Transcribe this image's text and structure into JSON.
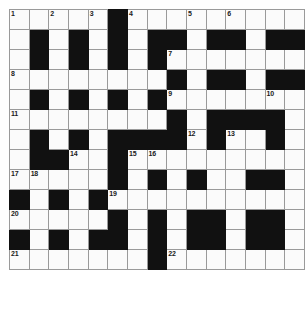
{
  "puzzle": {
    "title": "Crossword Grid",
    "type": "crossword",
    "columns": 15,
    "rows": 13,
    "colors": {
      "block": "#111111",
      "cell": "#fbfbfb",
      "grid_line": "#9a9a9a",
      "number_text": "#1a1a1a",
      "background": "#ffffff"
    },
    "clue_numbers_present": [
      1,
      2,
      3,
      4,
      5,
      6,
      7,
      8,
      9,
      10,
      11,
      12,
      13,
      14,
      15,
      16,
      17,
      18,
      19,
      20,
      21,
      22
    ],
    "grid": [
      [
        {
          "block": false,
          "num": "1"
        },
        {
          "block": false,
          "num": ""
        },
        {
          "block": false,
          "num": "2"
        },
        {
          "block": false,
          "num": ""
        },
        {
          "block": false,
          "num": "3"
        },
        {
          "block": true,
          "num": ""
        },
        {
          "block": false,
          "num": "4"
        },
        {
          "block": false,
          "num": ""
        },
        {
          "block": false,
          "num": ""
        },
        {
          "block": false,
          "num": "5"
        },
        {
          "block": false,
          "num": ""
        },
        {
          "block": false,
          "num": "6"
        },
        {
          "block": false,
          "num": ""
        },
        {
          "block": false,
          "num": ""
        },
        {
          "block": false,
          "num": ""
        }
      ],
      [
        {
          "block": false,
          "num": ""
        },
        {
          "block": true,
          "num": ""
        },
        {
          "block": false,
          "num": ""
        },
        {
          "block": true,
          "num": ""
        },
        {
          "block": false,
          "num": ""
        },
        {
          "block": true,
          "num": ""
        },
        {
          "block": false,
          "num": ""
        },
        {
          "block": true,
          "num": ""
        },
        {
          "block": true,
          "num": ""
        },
        {
          "block": false,
          "num": ""
        },
        {
          "block": true,
          "num": ""
        },
        {
          "block": true,
          "num": ""
        },
        {
          "block": false,
          "num": ""
        },
        {
          "block": true,
          "num": ""
        },
        {
          "block": true,
          "num": ""
        }
      ],
      [
        {
          "block": false,
          "num": ""
        },
        {
          "block": true,
          "num": ""
        },
        {
          "block": false,
          "num": ""
        },
        {
          "block": true,
          "num": ""
        },
        {
          "block": false,
          "num": ""
        },
        {
          "block": true,
          "num": ""
        },
        {
          "block": false,
          "num": ""
        },
        {
          "block": true,
          "num": ""
        },
        {
          "block": false,
          "num": "7"
        },
        {
          "block": false,
          "num": ""
        },
        {
          "block": false,
          "num": ""
        },
        {
          "block": false,
          "num": ""
        },
        {
          "block": false,
          "num": ""
        },
        {
          "block": false,
          "num": ""
        },
        {
          "block": false,
          "num": ""
        }
      ],
      [
        {
          "block": false,
          "num": "8"
        },
        {
          "block": false,
          "num": ""
        },
        {
          "block": false,
          "num": ""
        },
        {
          "block": false,
          "num": ""
        },
        {
          "block": false,
          "num": ""
        },
        {
          "block": false,
          "num": ""
        },
        {
          "block": false,
          "num": ""
        },
        {
          "block": false,
          "num": ""
        },
        {
          "block": true,
          "num": ""
        },
        {
          "block": false,
          "num": ""
        },
        {
          "block": true,
          "num": ""
        },
        {
          "block": true,
          "num": ""
        },
        {
          "block": false,
          "num": ""
        },
        {
          "block": true,
          "num": ""
        },
        {
          "block": true,
          "num": ""
        }
      ],
      [
        {
          "block": false,
          "num": ""
        },
        {
          "block": true,
          "num": ""
        },
        {
          "block": false,
          "num": ""
        },
        {
          "block": true,
          "num": ""
        },
        {
          "block": false,
          "num": ""
        },
        {
          "block": true,
          "num": ""
        },
        {
          "block": false,
          "num": ""
        },
        {
          "block": true,
          "num": ""
        },
        {
          "block": false,
          "num": "9"
        },
        {
          "block": false,
          "num": ""
        },
        {
          "block": false,
          "num": ""
        },
        {
          "block": false,
          "num": ""
        },
        {
          "block": false,
          "num": ""
        },
        {
          "block": false,
          "num": "10"
        },
        {
          "block": false,
          "num": ""
        }
      ],
      [
        {
          "block": false,
          "num": "11"
        },
        {
          "block": false,
          "num": ""
        },
        {
          "block": false,
          "num": ""
        },
        {
          "block": false,
          "num": ""
        },
        {
          "block": false,
          "num": ""
        },
        {
          "block": false,
          "num": ""
        },
        {
          "block": false,
          "num": ""
        },
        {
          "block": false,
          "num": ""
        },
        {
          "block": true,
          "num": ""
        },
        {
          "block": false,
          "num": ""
        },
        {
          "block": true,
          "num": ""
        },
        {
          "block": true,
          "num": ""
        },
        {
          "block": true,
          "num": ""
        },
        {
          "block": true,
          "num": ""
        },
        {
          "block": false,
          "num": ""
        }
      ],
      [
        {
          "block": false,
          "num": ""
        },
        {
          "block": true,
          "num": ""
        },
        {
          "block": false,
          "num": ""
        },
        {
          "block": true,
          "num": ""
        },
        {
          "block": false,
          "num": ""
        },
        {
          "block": true,
          "num": ""
        },
        {
          "block": true,
          "num": ""
        },
        {
          "block": true,
          "num": ""
        },
        {
          "block": true,
          "num": ""
        },
        {
          "block": false,
          "num": "12"
        },
        {
          "block": true,
          "num": ""
        },
        {
          "block": false,
          "num": "13"
        },
        {
          "block": false,
          "num": ""
        },
        {
          "block": true,
          "num": ""
        },
        {
          "block": false,
          "num": ""
        }
      ],
      [
        {
          "block": false,
          "num": ""
        },
        {
          "block": true,
          "num": ""
        },
        {
          "block": true,
          "num": ""
        },
        {
          "block": false,
          "num": "14"
        },
        {
          "block": false,
          "num": ""
        },
        {
          "block": true,
          "num": ""
        },
        {
          "block": false,
          "num": "15"
        },
        {
          "block": false,
          "num": "16"
        },
        {
          "block": false,
          "num": ""
        },
        {
          "block": false,
          "num": ""
        },
        {
          "block": false,
          "num": ""
        },
        {
          "block": false,
          "num": ""
        },
        {
          "block": false,
          "num": ""
        },
        {
          "block": false,
          "num": ""
        },
        {
          "block": false,
          "num": ""
        }
      ],
      [
        {
          "block": false,
          "num": "17"
        },
        {
          "block": false,
          "num": "18"
        },
        {
          "block": false,
          "num": ""
        },
        {
          "block": false,
          "num": ""
        },
        {
          "block": false,
          "num": ""
        },
        {
          "block": true,
          "num": ""
        },
        {
          "block": false,
          "num": ""
        },
        {
          "block": true,
          "num": ""
        },
        {
          "block": false,
          "num": ""
        },
        {
          "block": true,
          "num": ""
        },
        {
          "block": false,
          "num": ""
        },
        {
          "block": false,
          "num": ""
        },
        {
          "block": true,
          "num": ""
        },
        {
          "block": true,
          "num": ""
        },
        {
          "block": false,
          "num": ""
        }
      ],
      [
        {
          "block": true,
          "num": ""
        },
        {
          "block": false,
          "num": ""
        },
        {
          "block": true,
          "num": ""
        },
        {
          "block": false,
          "num": ""
        },
        {
          "block": true,
          "num": ""
        },
        {
          "block": false,
          "num": "19"
        },
        {
          "block": false,
          "num": ""
        },
        {
          "block": false,
          "num": ""
        },
        {
          "block": false,
          "num": ""
        },
        {
          "block": false,
          "num": ""
        },
        {
          "block": false,
          "num": ""
        },
        {
          "block": false,
          "num": ""
        },
        {
          "block": false,
          "num": ""
        },
        {
          "block": false,
          "num": ""
        },
        {
          "block": false,
          "num": ""
        }
      ],
      [
        {
          "block": false,
          "num": "20"
        },
        {
          "block": false,
          "num": ""
        },
        {
          "block": false,
          "num": ""
        },
        {
          "block": false,
          "num": ""
        },
        {
          "block": false,
          "num": ""
        },
        {
          "block": true,
          "num": ""
        },
        {
          "block": false,
          "num": ""
        },
        {
          "block": true,
          "num": ""
        },
        {
          "block": false,
          "num": ""
        },
        {
          "block": true,
          "num": ""
        },
        {
          "block": true,
          "num": ""
        },
        {
          "block": false,
          "num": ""
        },
        {
          "block": true,
          "num": ""
        },
        {
          "block": true,
          "num": ""
        },
        {
          "block": false,
          "num": ""
        }
      ],
      [
        {
          "block": true,
          "num": ""
        },
        {
          "block": false,
          "num": ""
        },
        {
          "block": true,
          "num": ""
        },
        {
          "block": false,
          "num": ""
        },
        {
          "block": true,
          "num": ""
        },
        {
          "block": true,
          "num": ""
        },
        {
          "block": false,
          "num": ""
        },
        {
          "block": true,
          "num": ""
        },
        {
          "block": false,
          "num": ""
        },
        {
          "block": true,
          "num": ""
        },
        {
          "block": true,
          "num": ""
        },
        {
          "block": false,
          "num": ""
        },
        {
          "block": true,
          "num": ""
        },
        {
          "block": true,
          "num": ""
        },
        {
          "block": false,
          "num": ""
        }
      ],
      [
        {
          "block": false,
          "num": "21"
        },
        {
          "block": false,
          "num": ""
        },
        {
          "block": false,
          "num": ""
        },
        {
          "block": false,
          "num": ""
        },
        {
          "block": false,
          "num": ""
        },
        {
          "block": false,
          "num": ""
        },
        {
          "block": false,
          "num": ""
        },
        {
          "block": true,
          "num": ""
        },
        {
          "block": false,
          "num": "22"
        },
        {
          "block": false,
          "num": ""
        },
        {
          "block": false,
          "num": ""
        },
        {
          "block": false,
          "num": ""
        },
        {
          "block": false,
          "num": ""
        },
        {
          "block": false,
          "num": ""
        },
        {
          "block": false,
          "num": ""
        }
      ]
    ]
  }
}
